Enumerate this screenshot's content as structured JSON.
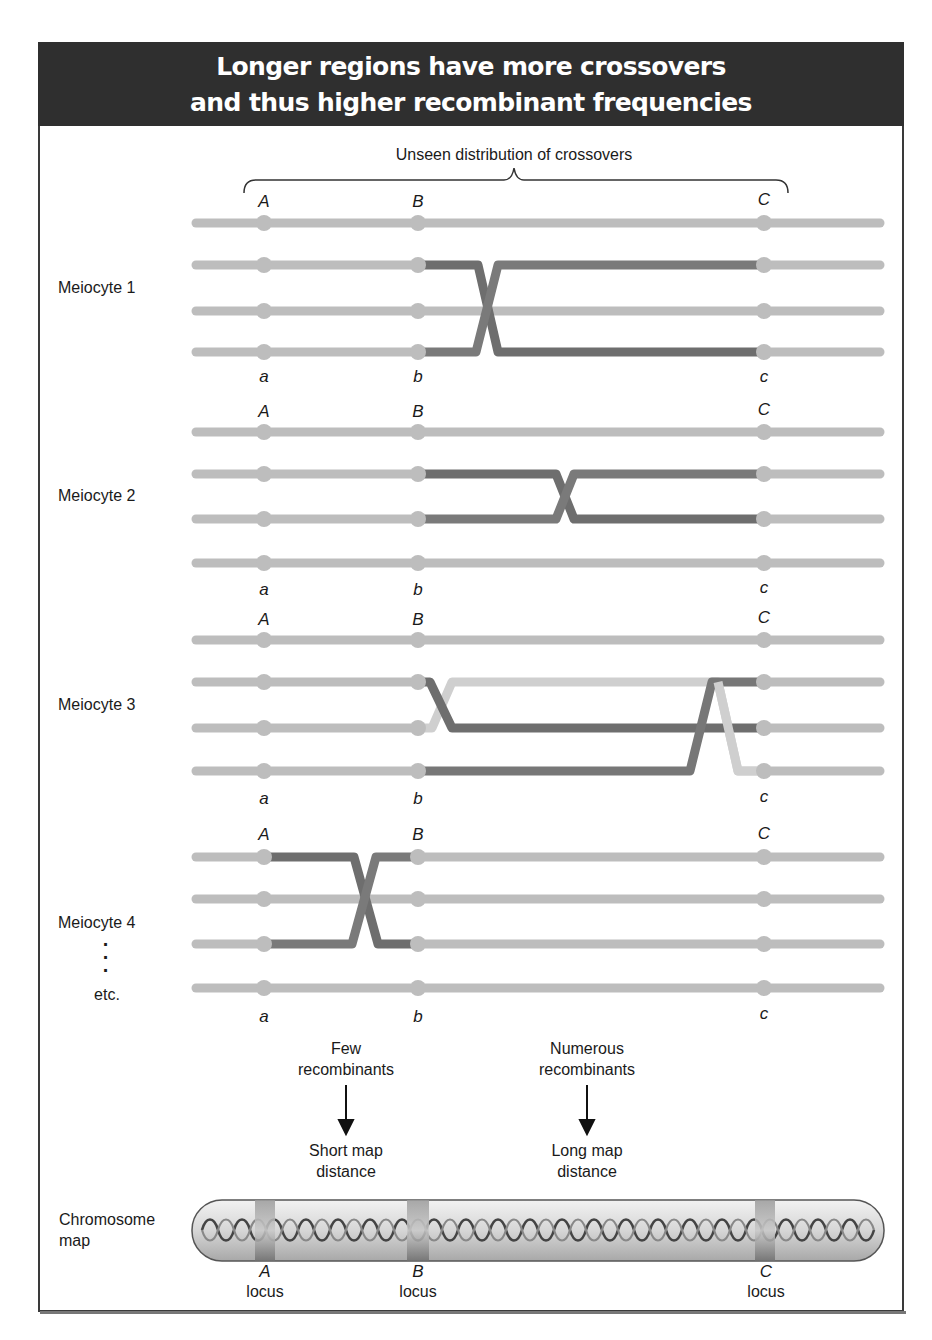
{
  "title": {
    "line1": "Longer regions have more crossovers",
    "line2": "and thus higher recombinant frequencies"
  },
  "brace_label": "Unseen distribution of crossovers",
  "loci": {
    "upper": [
      "A",
      "B",
      "C"
    ],
    "lower": [
      "a",
      "b",
      "c"
    ]
  },
  "meiocytes": [
    {
      "label": "Meiocyte 1",
      "crossover_region": "B-C",
      "crossover_strands": [
        2,
        4
      ],
      "crossovers": 1
    },
    {
      "label": "Meiocyte 2",
      "crossover_region": "B-C",
      "crossover_strands": [
        2,
        3
      ],
      "crossovers": 1
    },
    {
      "label": "Meiocyte 3",
      "crossover_region": "B-C",
      "crossover_strands": [
        [
          2,
          3
        ],
        [
          3,
          4
        ]
      ],
      "crossovers": 2
    },
    {
      "label": "Meiocyte 4",
      "crossover_region": "A-B",
      "crossover_strands": [
        1,
        3
      ],
      "crossovers": 1
    }
  ],
  "continuation": {
    "dots": "⋮",
    "label": "etc."
  },
  "outcomes": [
    {
      "top_line1": "Few",
      "top_line2": "recombinants",
      "bottom_line1": "Short map",
      "bottom_line2": "distance"
    },
    {
      "top_line1": "Numerous",
      "top_line2": "recombinants",
      "bottom_line1": "Long map",
      "bottom_line2": "distance"
    }
  ],
  "chromosome_map": {
    "label_line1": "Chromosome",
    "label_line2": "map",
    "loci": [
      {
        "name": "A",
        "suffix": "locus"
      },
      {
        "name": "B",
        "suffix": "locus"
      },
      {
        "name": "C",
        "suffix": "locus"
      }
    ]
  },
  "colors": {
    "header_bg": "#2f2f2f",
    "strand_light": "#bdbdbd",
    "strand_dark": "#6e6e6e",
    "strand_pale": "#d0d0d0",
    "frame": "#3a3a3a"
  }
}
